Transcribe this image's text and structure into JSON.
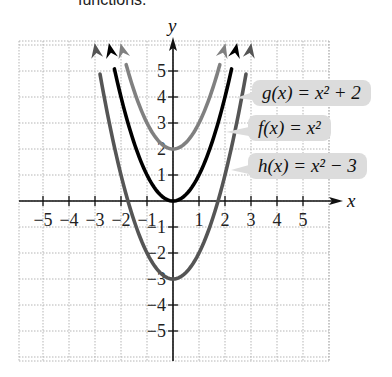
{
  "caption": "functions.",
  "chart_data": {
    "type": "line",
    "title": "",
    "xlabel": "x",
    "ylabel": "y",
    "xlim": [
      -6,
      6
    ],
    "ylim": [
      -6,
      6
    ],
    "grid": true,
    "x_ticks": [
      -5,
      -4,
      -3,
      -2,
      -1,
      1,
      2,
      3,
      4,
      5
    ],
    "y_ticks": [
      -5,
      -4,
      -3,
      -2,
      -1,
      1,
      2,
      3,
      4,
      5
    ],
    "series": [
      {
        "name": "g(x) = x² + 2",
        "formula": "x^2+2",
        "color": "#808080",
        "vertex": [
          0,
          2
        ]
      },
      {
        "name": "f(x) = x²",
        "formula": "x^2",
        "color": "#000000",
        "vertex": [
          0,
          0
        ]
      },
      {
        "name": "h(x) = x² − 3",
        "formula": "x^2-3",
        "color": "#555555",
        "vertex": [
          0,
          -3
        ]
      }
    ]
  },
  "labels": {
    "g": "g(x) = x² + 2",
    "f": "f(x) = x²",
    "h": "h(x) = x² − 3"
  },
  "axis": {
    "x": "x",
    "y": "y"
  }
}
